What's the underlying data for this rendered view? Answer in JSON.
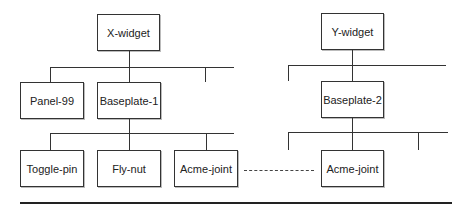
{
  "diagram": {
    "type": "hierarchy",
    "trees": [
      {
        "root": "X-widget",
        "level1": [
          "Panel-99",
          "Baseplate-1"
        ],
        "level2_under": "Baseplate-1",
        "level2": [
          "Toggle-pin",
          "Fly-nut",
          "Acme-joint"
        ]
      },
      {
        "root": "Y-widget",
        "level1": [
          "Baseplate-2"
        ],
        "level2_under": "Baseplate-2",
        "level2": [
          "Acme-joint"
        ]
      }
    ],
    "links": [
      {
        "from": "Acme-joint (X-widget tree)",
        "to": "Acme-joint (Y-widget tree)",
        "style": "dashed"
      }
    ]
  },
  "nodes": {
    "x_widget": "X-widget",
    "panel_99": "Panel-99",
    "baseplate_1": "Baseplate-1",
    "toggle_pin": "Toggle-pin",
    "fly_nut": "Fly-nut",
    "acme_joint_left": "Acme-joint",
    "y_widget": "Y-widget",
    "baseplate_2": "Baseplate-2",
    "acme_joint_right": "Acme-joint"
  }
}
